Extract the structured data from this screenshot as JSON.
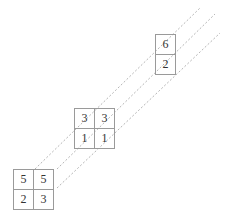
{
  "diagram": {
    "blocks": [
      {
        "id": "block-bottom-left",
        "rows": [
          [
            "5",
            "5"
          ],
          [
            "2",
            "3"
          ]
        ]
      },
      {
        "id": "block-middle",
        "rows": [
          [
            "3",
            "3"
          ],
          [
            "1",
            "1"
          ]
        ]
      },
      {
        "id": "block-top-right",
        "rows": [
          [
            "6"
          ],
          [
            "2"
          ]
        ]
      }
    ],
    "connector_style": "dashed",
    "line_color": "#b0b0b0",
    "border_color": "#9a9a9a"
  }
}
